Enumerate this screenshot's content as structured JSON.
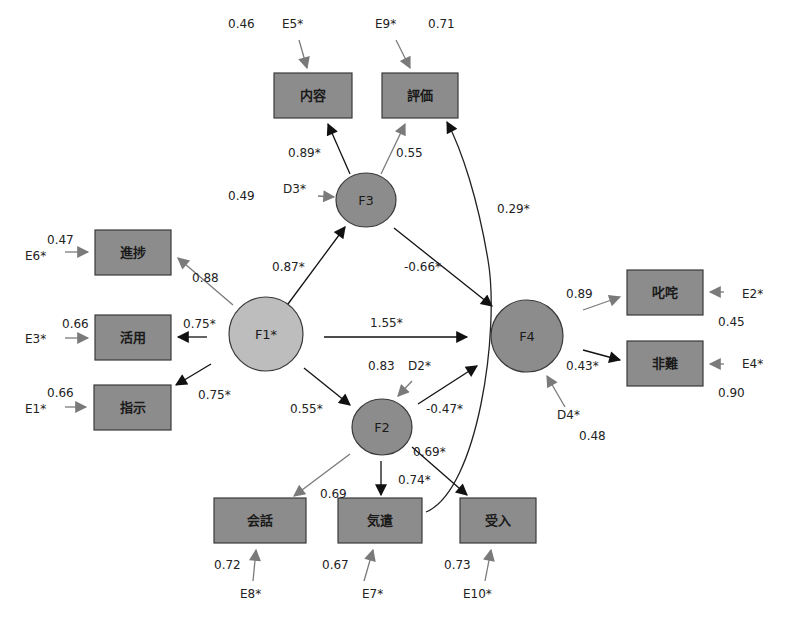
{
  "colors": {
    "significant": "#111111",
    "nonsignificant": "#7a7a7a",
    "observed_fill": "#8c8c8c",
    "factor_fill": "#8c8c8c",
    "exogenous_fill": "#bdbdbd"
  },
  "factors": [
    {
      "id": "F1",
      "label": "F1*",
      "cx": 266,
      "cy": 334,
      "rx": 37,
      "ry": 37,
      "fill": "#bdbdbd"
    },
    {
      "id": "F2",
      "label": "F2",
      "cx": 382,
      "cy": 427,
      "rx": 30,
      "ry": 28,
      "fill": "#8c8c8c"
    },
    {
      "id": "F3",
      "label": "F3",
      "cx": 366,
      "cy": 200,
      "rx": 30,
      "ry": 27,
      "fill": "#8c8c8c"
    },
    {
      "id": "F4",
      "label": "F4",
      "cx": 527,
      "cy": 336,
      "rx": 36,
      "ry": 36,
      "fill": "#8c8c8c"
    }
  ],
  "observed": [
    {
      "id": "naiyou",
      "label": "内容",
      "x": 274,
      "y": 73,
      "w": 78,
      "h": 45
    },
    {
      "id": "hyouka",
      "label": "評価",
      "x": 382,
      "y": 73,
      "w": 76,
      "h": 45
    },
    {
      "id": "shinchoku",
      "label": "進捗",
      "x": 95,
      "y": 230,
      "w": 76,
      "h": 45
    },
    {
      "id": "katsuyou",
      "label": "活用",
      "x": 95,
      "y": 315,
      "w": 76,
      "h": 45
    },
    {
      "id": "shiji",
      "label": "指示",
      "x": 94,
      "y": 385,
      "w": 77,
      "h": 45
    },
    {
      "id": "shitta",
      "label": "叱咤",
      "x": 627,
      "y": 270,
      "w": 76,
      "h": 45
    },
    {
      "id": "hinan",
      "label": "非難",
      "x": 627,
      "y": 341,
      "w": 76,
      "h": 45
    },
    {
      "id": "kaiwa",
      "label": "会話",
      "x": 214,
      "y": 498,
      "w": 92,
      "h": 45
    },
    {
      "id": "kizukai",
      "label": "気遣",
      "x": 338,
      "y": 498,
      "w": 84,
      "h": 45
    },
    {
      "id": "ukeire",
      "label": "受入",
      "x": 460,
      "y": 498,
      "w": 76,
      "h": 45
    }
  ],
  "paths": [
    {
      "from": "F3",
      "to": "内容",
      "coef": "0.89*",
      "sig": true,
      "x1": 350,
      "y1": 174,
      "x2": 328,
      "y2": 124,
      "lx": 288,
      "ly": 157
    },
    {
      "from": "F3",
      "to": "評価",
      "coef": "0.55",
      "sig": false,
      "x1": 381,
      "y1": 174,
      "x2": 405,
      "y2": 124,
      "lx": 396,
      "ly": 157
    },
    {
      "from": "F1",
      "to": "進捗",
      "coef": "0.88",
      "sig": false,
      "x1": 233,
      "y1": 305,
      "x2": 178,
      "y2": 258,
      "lx": 192,
      "ly": 282
    },
    {
      "from": "F1",
      "to": "活用",
      "coef": "0.75*",
      "sig": true,
      "x1": 207,
      "y1": 337,
      "x2": 178,
      "y2": 337,
      "lx": 183,
      "ly": 328
    },
    {
      "from": "F1",
      "to": "指示",
      "coef": "0.75*",
      "sig": true,
      "x1": 211,
      "y1": 364,
      "x2": 176,
      "y2": 385,
      "lx": 198,
      "ly": 399
    },
    {
      "from": "F1",
      "to": "F3",
      "coef": "0.87*",
      "sig": true,
      "x1": 288,
      "y1": 304,
      "x2": 345,
      "y2": 227,
      "lx": 272,
      "ly": 271
    },
    {
      "from": "F1",
      "to": "F4",
      "coef": "1.55*",
      "sig": true,
      "x1": 324,
      "y1": 337,
      "x2": 467,
      "y2": 337,
      "lx": 370,
      "ly": 327
    },
    {
      "from": "F1",
      "to": "F2",
      "coef": "0.55*",
      "sig": true,
      "x1": 304,
      "y1": 368,
      "x2": 350,
      "y2": 405,
      "lx": 290,
      "ly": 413
    },
    {
      "from": "F3",
      "to": "F4",
      "coef": "-0.66*",
      "sig": true,
      "x1": 394,
      "y1": 228,
      "x2": 492,
      "y2": 306,
      "lx": 404,
      "ly": 271
    },
    {
      "from": "F2",
      "to": "F4",
      "coef": "-0.47*",
      "sig": true,
      "x1": 418,
      "y1": 404,
      "x2": 477,
      "y2": 366,
      "lx": 426,
      "ly": 413
    },
    {
      "from": "F4",
      "to": "叱咤",
      "coef": "0.89",
      "sig": false,
      "x1": 583,
      "y1": 310,
      "x2": 620,
      "y2": 297,
      "lx": 566,
      "ly": 298
    },
    {
      "from": "F4",
      "to": "非難",
      "coef": "0.43*",
      "sig": true,
      "x1": 583,
      "y1": 350,
      "x2": 620,
      "y2": 360,
      "lx": 566,
      "ly": 370
    },
    {
      "from": "F2",
      "to": "会話",
      "coef": "0.69",
      "sig": false,
      "x1": 350,
      "y1": 454,
      "x2": 294,
      "y2": 496,
      "lx": 320,
      "ly": 498
    },
    {
      "from": "F2",
      "to": "気遣",
      "coef": "0.74*",
      "sig": true,
      "x1": 381,
      "y1": 461,
      "x2": 381,
      "y2": 495,
      "lx": 398,
      "ly": 484
    },
    {
      "from": "F2",
      "to": "受入",
      "coef": "0.69*",
      "sig": true,
      "x1": 412,
      "y1": 447,
      "x2": 467,
      "y2": 495,
      "lx": 413,
      "ly": 456
    }
  ],
  "covariance": {
    "from": "気遣",
    "to": "評価",
    "coef": "0.29*",
    "lx": 497,
    "ly": 213
  },
  "errors": [
    {
      "name": "E5*",
      "target": "内容",
      "variance": "0.46",
      "nx": 282,
      "ny": 28,
      "vx": 228,
      "vy": 28,
      "x1": 299,
      "y1": 40,
      "x2": 307,
      "y2": 68
    },
    {
      "name": "E9*",
      "target": "評価",
      "variance": "0.71",
      "nx": 375,
      "ny": 28,
      "vx": 428,
      "vy": 28,
      "x1": 396,
      "y1": 40,
      "x2": 410,
      "y2": 68
    },
    {
      "name": "D3*",
      "target": "F3",
      "variance": "0.49",
      "nx": 283,
      "ny": 193,
      "vx": 228,
      "vy": 200,
      "x1": 318,
      "y1": 196,
      "x2": 334,
      "y2": 197
    },
    {
      "name": "E6*",
      "target": "進捗",
      "variance": "0.47",
      "nx": 25,
      "ny": 260,
      "vx": 47,
      "vy": 244,
      "x1": 65,
      "y1": 252,
      "x2": 88,
      "y2": 252
    },
    {
      "name": "E3*",
      "target": "活用",
      "variance": "0.66",
      "nx": 25,
      "ny": 343,
      "vx": 62,
      "vy": 328,
      "x1": 65,
      "y1": 338,
      "x2": 88,
      "y2": 338
    },
    {
      "name": "E1*",
      "target": "指示",
      "variance": "0.66",
      "nx": 25,
      "ny": 413,
      "vx": 47,
      "vy": 397,
      "x1": 65,
      "y1": 407,
      "x2": 86,
      "y2": 407
    },
    {
      "name": "D2*",
      "target": "F2",
      "variance": "0.83",
      "nx": 408,
      "ny": 370,
      "vx": 368,
      "vy": 370,
      "x1": 412,
      "y1": 381,
      "x2": 398,
      "y2": 396
    },
    {
      "name": "E2*",
      "target": "叱咤",
      "variance": "0.45",
      "nx": 742,
      "ny": 298,
      "vx": 718,
      "vy": 326,
      "x1": 724,
      "y1": 292,
      "x2": 710,
      "y2": 292
    },
    {
      "name": "E4*",
      "target": "非難",
      "variance": "0.90",
      "nx": 742,
      "ny": 368,
      "vx": 718,
      "vy": 397,
      "x1": 724,
      "y1": 364,
      "x2": 710,
      "y2": 364
    },
    {
      "name": "D4*",
      "target": "F4",
      "variance": "0.48",
      "nx": 557,
      "ny": 419,
      "vx": 579,
      "vy": 440,
      "x1": 565,
      "y1": 407,
      "x2": 547,
      "y2": 376
    },
    {
      "name": "E8*",
      "target": "会話",
      "variance": "0.72",
      "nx": 240,
      "ny": 598,
      "vx": 214,
      "vy": 569,
      "x1": 253,
      "y1": 581,
      "x2": 256,
      "y2": 550
    },
    {
      "name": "E7*",
      "target": "気遣",
      "variance": "0.67",
      "nx": 362,
      "ny": 598,
      "vx": 322,
      "vy": 569,
      "x1": 364,
      "y1": 581,
      "x2": 373,
      "y2": 550
    },
    {
      "name": "E10*",
      "target": "受入",
      "variance": "0.73",
      "nx": 463,
      "ny": 598,
      "vx": 444,
      "vy": 569,
      "x1": 485,
      "y1": 581,
      "x2": 491,
      "y2": 550
    }
  ]
}
